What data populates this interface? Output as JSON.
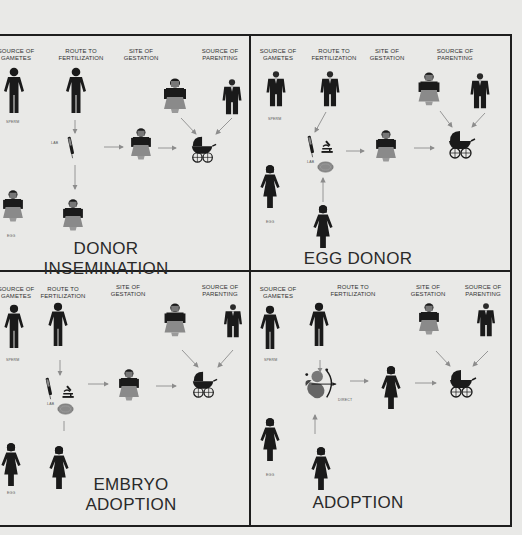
{
  "columns": {
    "gametes": "SOURCE OF GAMETES",
    "route": "ROUTE TO FERTILIZATION",
    "gestation": "SITE OF GESTATION",
    "parenting": "SOURCE OF PARENTING"
  },
  "labels": {
    "sperm": "SPERM",
    "egg": "EGG",
    "lab": "LAB",
    "direct": "DIRECT"
  },
  "panels": [
    {
      "id": "donor-insemination",
      "title_line1": "DONOR",
      "title_line2": "INSEMINATION"
    },
    {
      "id": "egg-donor",
      "title_line1": "EGG DONOR",
      "title_line2": ""
    },
    {
      "id": "embryo-adoption",
      "title_line1": "EMBRYO",
      "title_line2": "ADOPTION"
    },
    {
      "id": "adoption",
      "title_line1": "ADOPTION",
      "title_line2": ""
    }
  ],
  "icons": {
    "man_silhouette": "man-silhouette-icon",
    "woman_silhouette": "woman-silhouette-icon",
    "man_suit": "man-in-suit-icon",
    "woman_dress": "woman-in-dress-icon",
    "syringe": "syringe-icon",
    "microscope": "microscope-icon",
    "petri_dish": "petri-dish-icon",
    "baby_carriage": "baby-carriage-icon",
    "cupid": "cupid-icon"
  },
  "colors": {
    "ink": "#1a1a1a",
    "skirt": "#8a8a8a",
    "background": "#f2f2f0",
    "border": "#1e1e1e",
    "arrow": "#8c8c8c"
  }
}
